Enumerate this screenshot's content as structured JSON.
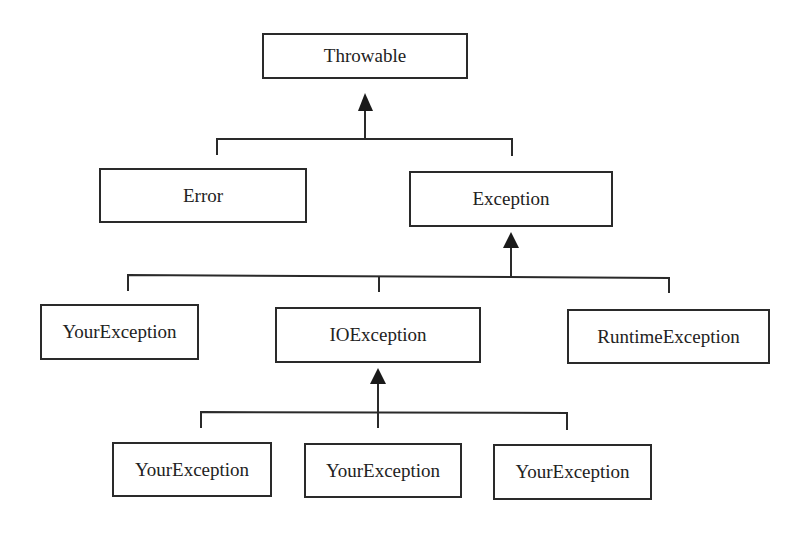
{
  "diagram": {
    "type": "class-hierarchy",
    "nodes": {
      "throwable": "Throwable",
      "error": "Error",
      "exception": "Exception",
      "your_exception_1": "YourException",
      "io_exception": "IOException",
      "runtime_exception": "RuntimeException",
      "your_exception_2": "YourException",
      "your_exception_3": "YourException",
      "your_exception_4": "YourException"
    },
    "edges": [
      {
        "from": "Error",
        "to": "Throwable"
      },
      {
        "from": "Exception",
        "to": "Throwable"
      },
      {
        "from": "YourException",
        "to": "Exception"
      },
      {
        "from": "IOException",
        "to": "Exception"
      },
      {
        "from": "RuntimeException",
        "to": "Exception"
      },
      {
        "from": "YourException",
        "to": "IOException"
      },
      {
        "from": "YourException",
        "to": "IOException"
      },
      {
        "from": "YourException",
        "to": "IOException"
      }
    ],
    "colors": {
      "line": "#2a2a2a",
      "background": "#ffffff",
      "text": "#222222"
    }
  }
}
